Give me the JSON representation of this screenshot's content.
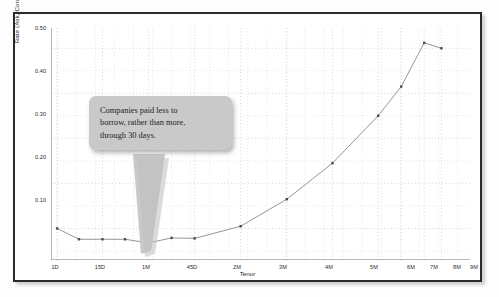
{
  "figure": {
    "name": "yield-curve-chart"
  },
  "chart_data": {
    "type": "line",
    "title": "",
    "xlabel": "Tenor",
    "ylabel": "Rate (Ask, Conventional %)",
    "categories": [
      "1D",
      "8D",
      "15D",
      "22D",
      "1M",
      "45D",
      "2M",
      "3M",
      "4M",
      "5M",
      "6M",
      "7M",
      "8M",
      "9M"
    ],
    "tick_categories": [
      "1D",
      "15D",
      "1M",
      "45D",
      "2M",
      "3M",
      "4M",
      "5M",
      "6M",
      "7M",
      "8M",
      "9M"
    ],
    "values": [
      0.1,
      0.076,
      0.076,
      0.076,
      0.068,
      0.079,
      0.078,
      0.105,
      0.165,
      0.245,
      0.35,
      0.415,
      0.512,
      0.5
    ],
    "ylim": [
      0.03,
      0.545
    ],
    "yticks": [
      "0.50",
      "0.40",
      "0.30",
      "0.20",
      "0.10"
    ],
    "ytick_values": [
      0.5,
      0.4,
      0.3,
      0.2,
      0.1
    ],
    "grid": true,
    "legend": "none",
    "series_color": "#8a8a8a",
    "marker_color": "#4a4a4a",
    "annotations": [
      {
        "name": "callout-bubble",
        "lines": [
          "Companies paid less to",
          "borrow, rather than more,",
          "through 30 days."
        ],
        "points_to": "1M"
      }
    ]
  },
  "colors": {
    "frame": "#2a2a2a",
    "grid_major": "#b9b9c6",
    "grid_minor": "#d6d6de",
    "callout_bg": "#c9c9c9",
    "text": "#232323"
  }
}
